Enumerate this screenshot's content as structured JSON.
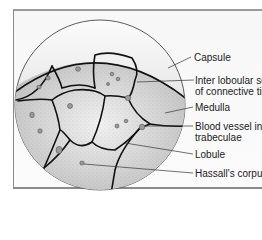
{
  "figure": {
    "labels": [
      {
        "id": "capsule",
        "lines": [
          "Capsule"
        ]
      },
      {
        "id": "interlobular-septa",
        "lines": [
          "Inter loboular se",
          "of connective tis"
        ]
      },
      {
        "id": "medulla",
        "lines": [
          "Medulla"
        ]
      },
      {
        "id": "blood-vessel",
        "lines": [
          "Blood vessel in",
          "trabeculae"
        ]
      },
      {
        "id": "lobule",
        "lines": [
          "Lobule"
        ]
      },
      {
        "id": "hassalls-corpuscle",
        "lines": [
          "Hassall's corpus"
        ]
      }
    ]
  },
  "colors": {
    "outline": "#111111",
    "lobule_fill": "#d8d8d8",
    "capsule_fill": "#e6e6e6",
    "frame": "#8a8a8a"
  }
}
